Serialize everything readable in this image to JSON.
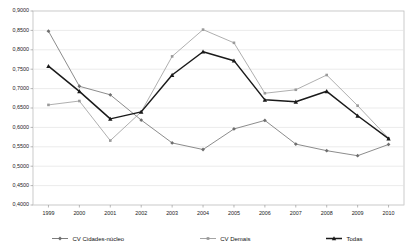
{
  "chart_data": {
    "type": "line",
    "title": "",
    "xlabel": "",
    "ylabel": "",
    "categories": [
      "1999",
      "2000",
      "2001",
      "2002",
      "2003",
      "2004",
      "2005",
      "2006",
      "2007",
      "2008",
      "2009",
      "2010"
    ],
    "ylim": [
      0.4,
      0.9
    ],
    "ytick_labels": [
      "0,9000",
      "0,8500",
      "0,8000",
      "0,7500",
      "0,7000",
      "0,6500",
      "0,6000",
      "0,5500",
      "0,5000",
      "0,4500",
      "0,4000"
    ],
    "ytick_values": [
      0.9,
      0.85,
      0.8,
      0.75,
      0.7,
      0.65,
      0.6,
      0.55,
      0.5,
      0.45,
      0.4
    ],
    "grid": true,
    "legend_position": "bottom",
    "series": [
      {
        "name": "CV Cidades-núcleo",
        "marker": "diamond",
        "color": "#6e6e6e",
        "values": [
          0.848,
          0.706,
          0.684,
          0.619,
          0.56,
          0.543,
          0.596,
          0.618,
          0.557,
          0.54,
          0.527,
          0.556
        ]
      },
      {
        "name": "CV Demais",
        "marker": "square",
        "color": "#9a9a9a",
        "values": [
          0.658,
          0.668,
          0.566,
          0.64,
          0.783,
          0.852,
          0.818,
          0.688,
          0.697,
          0.735,
          0.656,
          0.572
        ]
      },
      {
        "name": "Todas",
        "marker": "triangle",
        "color": "#1a1a1a",
        "values": [
          0.758,
          0.693,
          0.622,
          0.64,
          0.735,
          0.795,
          0.772,
          0.671,
          0.666,
          0.693,
          0.63,
          0.571
        ]
      }
    ]
  },
  "legend": {
    "items": [
      {
        "label": "CV Cidades-núcleo",
        "marker": "diamond",
        "color": "#6e6e6e"
      },
      {
        "label": "CV Demais",
        "marker": "square",
        "color": "#9a9a9a"
      },
      {
        "label": "Todas",
        "marker": "triangle",
        "color": "#1a1a1a"
      }
    ]
  }
}
